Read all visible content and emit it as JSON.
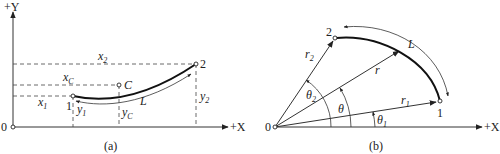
{
  "panel_a": {
    "caption": "(a)",
    "axis_y_label": "+Y",
    "axis_x_label": "+X",
    "origin_label": "0",
    "point_1_label": "1",
    "point_2_label": "2",
    "point_c_label": "C",
    "arc_length_label": "L",
    "x1": {
      "main": "x",
      "sub": "1"
    },
    "x2": {
      "main": "x",
      "sub": "2"
    },
    "xc": {
      "main": "x",
      "sub": "C"
    },
    "y1": {
      "main": "y",
      "sub": "1"
    },
    "y2": {
      "main": "y",
      "sub": "2"
    },
    "yc": {
      "main": "y",
      "sub": "C"
    }
  },
  "panel_b": {
    "caption": "(b)",
    "axis_x_label": "+X",
    "origin_label": "0",
    "point_1_label": "1",
    "point_2_label": "2",
    "arc_length_label": "L",
    "r": {
      "main": "r",
      "sub": ""
    },
    "r1": {
      "main": "r",
      "sub": "1"
    },
    "r2": {
      "main": "r",
      "sub": "2"
    },
    "theta": {
      "main": "θ",
      "sub": ""
    },
    "theta1": {
      "main": "θ",
      "sub": "1"
    },
    "theta2": {
      "main": "θ",
      "sub": "2"
    }
  },
  "colors": {
    "line": "#222222",
    "background": "#ffffff"
  }
}
